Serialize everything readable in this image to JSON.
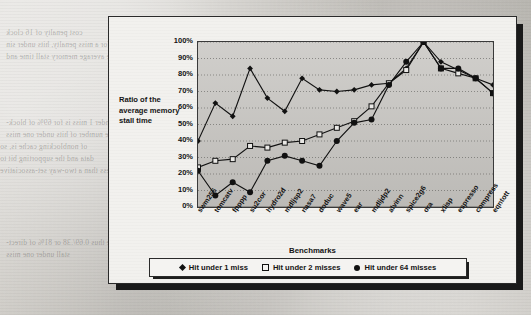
{
  "page": {
    "bleed_text": [
      "cost penalty of 16 clock",
      "for a miss penalty, hits under sin",
      "specify the average memory stall time and",
      "stall = 1.18 x 1.3 = 1.58",
      "penalty = 1.18 x 1.6 = 1.71",
      "hit under 1 miss is for 69% of block-",
      "the number of hits under one miss",
      "of nonblocking cache is, so",
      "data and the supporting bit to",
      "less than a two-way set-associative",
      "= 1.18 x 1.4 = 1.18",
      "penalty x index is x0.8",
      "are thus 0.69/.38 or 81% of direct-",
      "stall under one miss"
    ]
  },
  "chart_data": {
    "type": "line",
    "title": "",
    "xlabel": "Benchmarks",
    "ylabel": "Ratio of the average memory stall time",
    "ylim": [
      0,
      100
    ],
    "yticks": [
      "0%",
      "10%",
      "20%",
      "30%",
      "40%",
      "50%",
      "60%",
      "70%",
      "80%",
      "90%",
      "100%"
    ],
    "grid": true,
    "legend_position": "bottom",
    "categories": [
      "swm256",
      "tomcatv",
      "fpppp",
      "su2cor",
      "hydro2d",
      "mdljsp2",
      "nasa7",
      "doduc",
      "wave5",
      "ear",
      "mdljdp2",
      "alvinn",
      "spice2g6",
      "ora",
      "xlisp",
      "espresso",
      "compress",
      "eqntott"
    ],
    "series": [
      {
        "name": "Hit under 1 miss",
        "marker": "diamond",
        "values": [
          40,
          63,
          55,
          84,
          66,
          58,
          78,
          71,
          70,
          71,
          74,
          75,
          84,
          100,
          88,
          83,
          78,
          74
        ]
      },
      {
        "name": "Hit under 2 misses",
        "marker": "open-square",
        "values": [
          24,
          28,
          29,
          37,
          36,
          39,
          40,
          44,
          48,
          52,
          61,
          75,
          83,
          100,
          84,
          81,
          78,
          69
        ]
      },
      {
        "name": "Hit under 64 misses",
        "marker": "filled-circle",
        "values": [
          22,
          7,
          15,
          9,
          28,
          31,
          28,
          25,
          40,
          51,
          53,
          74,
          88,
          100,
          84,
          84,
          78,
          69
        ]
      }
    ]
  },
  "legend": {
    "items": [
      {
        "label": "Hit under 1 miss",
        "marker": "diamond"
      },
      {
        "label": "Hit under 2 misses",
        "marker": "open-square"
      },
      {
        "label": "Hit under 64 misses",
        "marker": "filled-circle"
      }
    ]
  }
}
